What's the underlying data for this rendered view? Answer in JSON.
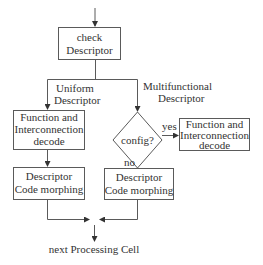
{
  "diagram": {
    "type": "flowchart",
    "nodes": {
      "check": {
        "lines": [
          "check",
          "Descriptor"
        ]
      },
      "left_decode": {
        "lines": [
          "Function and",
          "Interconnection",
          "decode"
        ]
      },
      "config": {
        "label": "config?"
      },
      "right_decode": {
        "lines": [
          "Function and",
          "Interconnection",
          "decode"
        ]
      },
      "left_morph": {
        "lines": [
          "Descriptor",
          "Code morphing"
        ]
      },
      "right_morph": {
        "lines": [
          "Descriptor",
          "Code morphing"
        ]
      },
      "next": {
        "label": "next Processing Cell"
      }
    },
    "edge_labels": {
      "uniform": [
        "Uniform",
        "Descriptor"
      ],
      "multifunctional": [
        "Multifunctional",
        "Descriptor"
      ],
      "yes": "yes",
      "no": "no"
    },
    "edges": [
      {
        "from": "start",
        "to": "check"
      },
      {
        "from": "check",
        "to": "left_decode",
        "label": "Uniform Descriptor"
      },
      {
        "from": "check",
        "to": "config",
        "label": "Multifunctional Descriptor"
      },
      {
        "from": "config",
        "to": "right_decode",
        "label": "yes"
      },
      {
        "from": "config",
        "to": "right_morph",
        "label": "no"
      },
      {
        "from": "left_decode",
        "to": "left_morph"
      },
      {
        "from": "left_morph",
        "to": "next"
      },
      {
        "from": "right_morph",
        "to": "next"
      }
    ]
  }
}
